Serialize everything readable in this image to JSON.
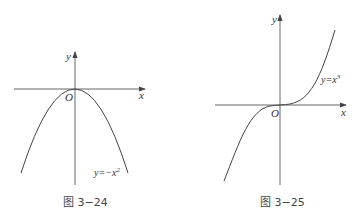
{
  "figures": [
    {
      "id": "fig-3-24",
      "caption": "图 3−24",
      "axis_x_label": "x",
      "axis_y_label": "y",
      "origin_label": "O",
      "curve_label_base": "y=−x",
      "curve_label_exp": "2",
      "function": "y = -x^2"
    },
    {
      "id": "fig-3-25",
      "caption": "图 3−25",
      "axis_x_label": "x",
      "axis_y_label": "y",
      "origin_label": "O",
      "curve_label_base": "y=x",
      "curve_label_exp": "3",
      "function": "y = x^3"
    }
  ],
  "colors": {
    "axis": "#555555",
    "curve": "#444444",
    "text": "#333333"
  }
}
